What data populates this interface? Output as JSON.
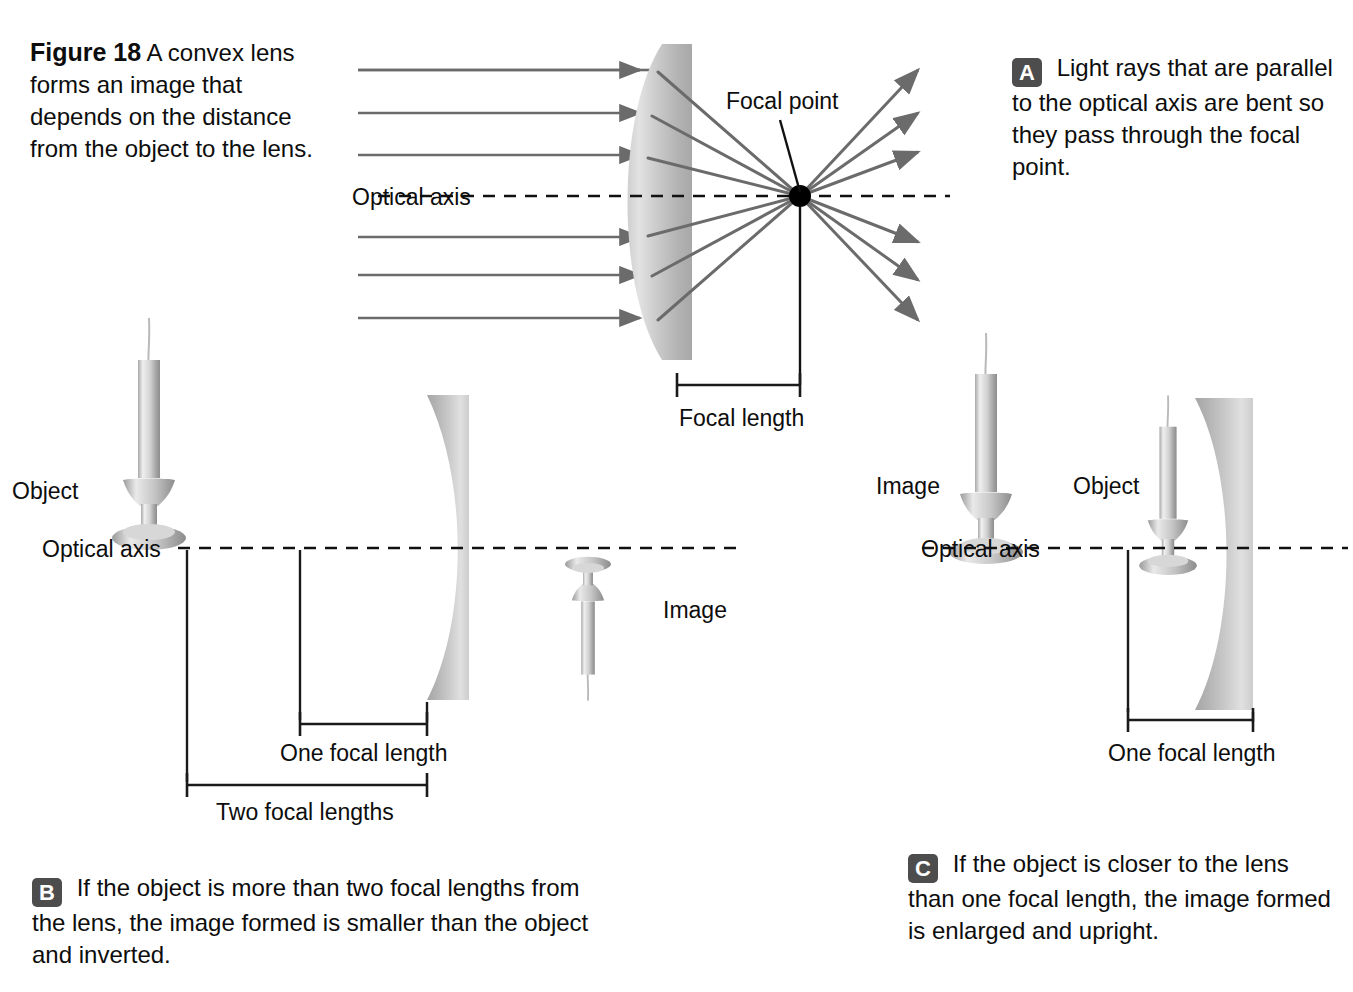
{
  "figure": {
    "number_label": "Figure 18",
    "caption": " A convex lens forms an image that depends on the distance from the object to the lens."
  },
  "panels": {
    "a": {
      "badge": "A",
      "text": " Light rays that are parallel to the optical axis are bent so they pass through the focal point.",
      "labels": {
        "optical_axis": "Optical axis",
        "focal_point": "Focal point",
        "focal_length": "Focal length"
      },
      "ray_count_in": 6,
      "ray_count_out": 6
    },
    "b": {
      "badge": "B",
      "text": " If the object is more than two focal lengths from the lens, the image formed is smaller than the object and inverted.",
      "labels": {
        "object": "Object",
        "optical_axis": "Optical axis",
        "image": "Image",
        "one_focal_length": "One focal length",
        "two_focal_lengths": "Two focal lengths"
      }
    },
    "c": {
      "badge": "C",
      "text": " If the object is closer to the lens than one focal length, the image formed is enlarged and upright.",
      "labels": {
        "image": "Image",
        "object": "Object",
        "optical_axis": "Optical axis",
        "one_focal_length": "One focal length"
      }
    }
  },
  "colors": {
    "background": "#ffffff",
    "text": "#0d0d0d",
    "badge_bg": "#4d4d4d",
    "badge_text": "#ffffff",
    "ray": "#6b6b6b",
    "axis_dash": "#111111",
    "lens_light": "#d9d9d9",
    "lens_mid": "#bdbdbd",
    "lens_dark": "#9e9e9e",
    "focal_point_dot": "#000000",
    "bracket": "#1a1a1a",
    "candle_light": "#e8e8e8",
    "candle_mid": "#c2c2c2",
    "candle_dark": "#8f8f8f"
  }
}
